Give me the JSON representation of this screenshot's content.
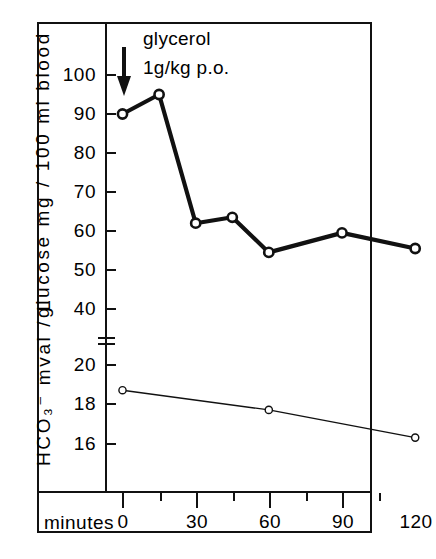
{
  "page": {
    "header_text": "",
    "page_number": ""
  },
  "annotation": {
    "line1": "glycerol",
    "line2": "1g/kg p.o.",
    "arrow_icon": "down-arrow-icon"
  },
  "axes": {
    "glucose": {
      "title": "glucose  mg / 100 ml blood",
      "ticks": [
        "100",
        "90",
        "80",
        "70",
        "60",
        "50",
        "40"
      ],
      "tick_values": [
        100,
        90,
        80,
        70,
        60,
        50,
        40
      ]
    },
    "bicarbonate": {
      "title": "HCO₃⁻ mval / L",
      "ticks": [
        "20",
        "18",
        "16"
      ],
      "tick_values": [
        20,
        18,
        16
      ]
    },
    "x": {
      "title": "minutes",
      "ticks": [
        "0",
        "30",
        "60",
        "90",
        "120"
      ],
      "tick_values": [
        0,
        30,
        60,
        90,
        120
      ],
      "minor_tick_values": [
        15,
        45,
        75,
        105
      ]
    }
  },
  "chart_data": {
    "type": "line",
    "title": "",
    "xlabel": "minutes",
    "annotations": [
      "glycerol 1g/kg p.o. at t = 0"
    ],
    "grid": false,
    "legend": "none",
    "panels": [
      {
        "name": "glucose",
        "ylabel": "glucose  mg / 100 ml blood",
        "ylim": [
          35,
          103
        ],
        "yticks": [
          40,
          50,
          60,
          70,
          80,
          90,
          100
        ],
        "marker": "open-circle",
        "line_width": "thick",
        "x": [
          0,
          15,
          30,
          45,
          60,
          90,
          120
        ],
        "values": [
          90,
          95,
          62,
          63.5,
          54.5,
          59.5,
          55.5
        ]
      },
      {
        "name": "bicarbonate",
        "ylabel": "HCO₃⁻ mval / L",
        "ylim": [
          15,
          21.5
        ],
        "yticks": [
          16,
          18,
          20
        ],
        "marker": "open-circle",
        "line_width": "thin",
        "x": [
          0,
          60,
          120
        ],
        "values": [
          18.7,
          17.7,
          16.3
        ]
      }
    ],
    "xlim": [
      -8,
      128
    ],
    "axis_break": true
  }
}
